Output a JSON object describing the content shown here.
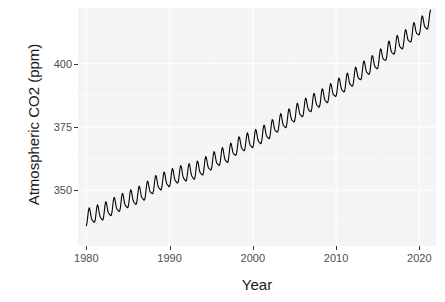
{
  "chart_data": {
    "type": "line",
    "title": "",
    "subtitle": "",
    "xlabel": "Year",
    "ylabel": "Atmospheric CO2 (ppm)",
    "xlim": [
      1979.0,
      2022.0
    ],
    "ylim": [
      328.0,
      422.0
    ],
    "xticks": [
      1980,
      1990,
      2000,
      2010,
      2020
    ],
    "xtick_labels": [
      "1980",
      "1990",
      "2000",
      "2010",
      "2020"
    ],
    "yticks": [
      350,
      375,
      400
    ],
    "ytick_labels": [
      "350",
      "375",
      "400"
    ],
    "grid": true,
    "grid_major_color": "#ffffff",
    "grid_minor_color": "#fafafa",
    "panel_background": "#f4f4f4",
    "legend": null,
    "legend_position": "none",
    "series": [
      {
        "name": "Atmospheric CO2",
        "color": "#000000",
        "line_width": 1.1,
        "description": "Keeling curve: monthly mean atmospheric CO2 with seasonal oscillation superimposed on a rising trend.",
        "seasonal_amplitude_ppm": 3.1,
        "annual_means": [
          {
            "year": 1980,
            "value": 338.7
          },
          {
            "year": 1981,
            "value": 340.1
          },
          {
            "year": 1982,
            "value": 341.0
          },
          {
            "year": 1983,
            "value": 342.8
          },
          {
            "year": 1984,
            "value": 344.4
          },
          {
            "year": 1985,
            "value": 345.9
          },
          {
            "year": 1986,
            "value": 347.2
          },
          {
            "year": 1987,
            "value": 348.9
          },
          {
            "year": 1988,
            "value": 351.5
          },
          {
            "year": 1989,
            "value": 352.9
          },
          {
            "year": 1990,
            "value": 354.2
          },
          {
            "year": 1991,
            "value": 355.6
          },
          {
            "year": 1992,
            "value": 356.4
          },
          {
            "year": 1993,
            "value": 357.1
          },
          {
            "year": 1994,
            "value": 358.8
          },
          {
            "year": 1995,
            "value": 360.8
          },
          {
            "year": 1996,
            "value": 362.6
          },
          {
            "year": 1997,
            "value": 363.7
          },
          {
            "year": 1998,
            "value": 366.7
          },
          {
            "year": 1999,
            "value": 368.4
          },
          {
            "year": 2000,
            "value": 369.6
          },
          {
            "year": 2001,
            "value": 371.2
          },
          {
            "year": 2002,
            "value": 373.2
          },
          {
            "year": 2003,
            "value": 375.8
          },
          {
            "year": 2004,
            "value": 377.5
          },
          {
            "year": 2005,
            "value": 379.8
          },
          {
            "year": 2006,
            "value": 381.9
          },
          {
            "year": 2007,
            "value": 383.8
          },
          {
            "year": 2008,
            "value": 385.6
          },
          {
            "year": 2009,
            "value": 387.4
          },
          {
            "year": 2010,
            "value": 389.9
          },
          {
            "year": 2011,
            "value": 391.6
          },
          {
            "year": 2012,
            "value": 393.9
          },
          {
            "year": 2013,
            "value": 396.5
          },
          {
            "year": 2014,
            "value": 398.6
          },
          {
            "year": 2015,
            "value": 400.8
          },
          {
            "year": 2016,
            "value": 404.2
          },
          {
            "year": 2017,
            "value": 406.6
          },
          {
            "year": 2018,
            "value": 408.6
          },
          {
            "year": 2019,
            "value": 411.4
          },
          {
            "year": 2020,
            "value": 414.2
          },
          {
            "year": 2021,
            "value": 416.5
          }
        ],
        "start_year": 1980.0,
        "end_year": 2021.4,
        "start_value_ppm": 336.0,
        "end_value_ppm": 419.5,
        "min_value_ppm": 334.8,
        "max_value_ppm": 419.6
      }
    ]
  },
  "axes": {
    "y_title": "Atmospheric CO2 (ppm)",
    "x_title": "Year"
  }
}
